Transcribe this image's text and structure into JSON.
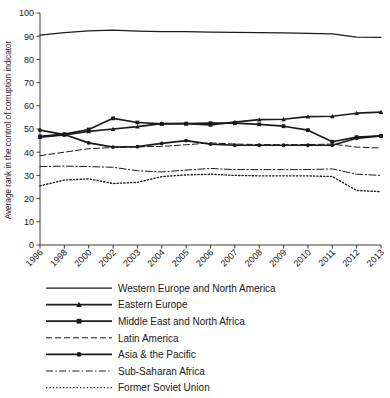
{
  "chart_data": {
    "type": "line",
    "title": "",
    "xlabel": "",
    "ylabel": "Average rank in the control of corruption indicator",
    "ylim": [
      0,
      100
    ],
    "yticks": [
      0,
      10,
      20,
      30,
      40,
      50,
      60,
      70,
      80,
      90,
      100
    ],
    "grid": false,
    "legend_position": "below",
    "categories": [
      "1996",
      "1998",
      "2000",
      "2002",
      "2003",
      "2004",
      "2005",
      "2006",
      "2007",
      "2008",
      "2009",
      "2010",
      "2011",
      "2012",
      "2013"
    ],
    "series": [
      {
        "name": "Western Europe and North America",
        "style": "solid",
        "marker": "none",
        "values": [
          90.5,
          91.5,
          92.3,
          92.6,
          92.2,
          92.0,
          92.0,
          91.8,
          91.6,
          91.5,
          91.4,
          91.2,
          91.0,
          89.6,
          89.5
        ]
      },
      {
        "name": "Eastern Europe",
        "style": "solid",
        "marker": "triangle",
        "values": [
          46.5,
          47.5,
          49.0,
          50.0,
          51.0,
          52.3,
          52.3,
          51.8,
          53.0,
          54.0,
          54.2,
          55.3,
          55.5,
          56.8,
          57.3
        ]
      },
      {
        "name": "Middle East and North Africa",
        "style": "solid",
        "marker": "square",
        "values": [
          46.8,
          47.8,
          49.8,
          54.6,
          52.8,
          52.2,
          52.3,
          52.5,
          52.5,
          52.0,
          51.2,
          49.5,
          44.5,
          46.5,
          47.0
        ]
      },
      {
        "name": "Latin America",
        "style": "dashed",
        "marker": "none",
        "values": [
          38.5,
          40.0,
          41.5,
          42.0,
          42.3,
          42.5,
          43.2,
          44.0,
          43.5,
          43.3,
          43.2,
          43.3,
          43.5,
          42.2,
          41.8
        ]
      },
      {
        "name": "Asia & the Pacific",
        "style": "solid",
        "marker": "circle",
        "values": [
          49.5,
          47.6,
          44.0,
          42.2,
          42.4,
          43.8,
          45.0,
          43.5,
          43.0,
          43.0,
          43.0,
          43.0,
          43.0,
          46.0,
          47.0
        ]
      },
      {
        "name": "Sub-Saharan Africa",
        "style": "dashdot",
        "marker": "none",
        "values": [
          33.8,
          34.0,
          33.8,
          33.5,
          32.0,
          31.5,
          32.3,
          33.0,
          32.5,
          32.5,
          32.5,
          32.5,
          32.8,
          30.5,
          30.0
        ]
      },
      {
        "name": "Former Soviet Union",
        "style": "dotted",
        "marker": "none",
        "values": [
          25.5,
          28.0,
          28.5,
          26.5,
          27.0,
          29.5,
          30.2,
          30.5,
          30.0,
          29.8,
          29.8,
          29.8,
          29.5,
          23.5,
          23.0
        ]
      }
    ]
  },
  "legend": {
    "items": [
      {
        "label": "Western Europe and North America"
      },
      {
        "label": "Eastern Europe"
      },
      {
        "label": "Middle East and North Africa"
      },
      {
        "label": "Latin America"
      },
      {
        "label": "Asia & the Pacific"
      },
      {
        "label": "Sub-Saharan Africa"
      },
      {
        "label": "Former Soviet Union"
      }
    ]
  },
  "colors": {
    "line": "#1a1a1a",
    "axis": "#3a3a3a",
    "background": "#ffffff"
  }
}
